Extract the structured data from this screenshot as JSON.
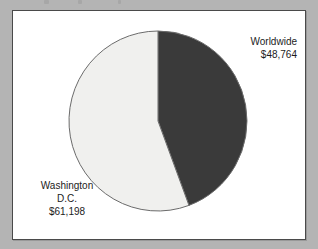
{
  "figure": {
    "background_color": "#b4b4b4",
    "frame_color": "#ffffff",
    "frame_border_color": "#4a4a4a"
  },
  "labels": {
    "worldwide": {
      "name": "Worldwide",
      "value": "$48,764"
    },
    "washington": {
      "name_line1": "Washington",
      "name_line2": "D.C.",
      "value": "$61,198"
    }
  },
  "chart_data": {
    "type": "pie",
    "title": "",
    "subtitle": "",
    "xlabel": "",
    "ylabel": "",
    "legend": "none",
    "grid": false,
    "start_angle_deg": 0,
    "direction": "clockwise",
    "total": 109962,
    "categories": [
      "Worldwide",
      "Washington D.C."
    ],
    "values": [
      48764,
      61198
    ],
    "value_labels": [
      "$48,764",
      "$61,198"
    ],
    "percentages": [
      44.3,
      55.7
    ],
    "colors": [
      "#3a3a3a",
      "#f0f0ee"
    ],
    "slice_border_color": "#6b6b6b",
    "annotations": [
      {
        "text": "Worldwide $48,764",
        "position": "right",
        "slice": "Worldwide"
      },
      {
        "text": "Washington D.C. $61,198",
        "position": "bottom-left",
        "slice": "Washington D.C."
      }
    ]
  }
}
